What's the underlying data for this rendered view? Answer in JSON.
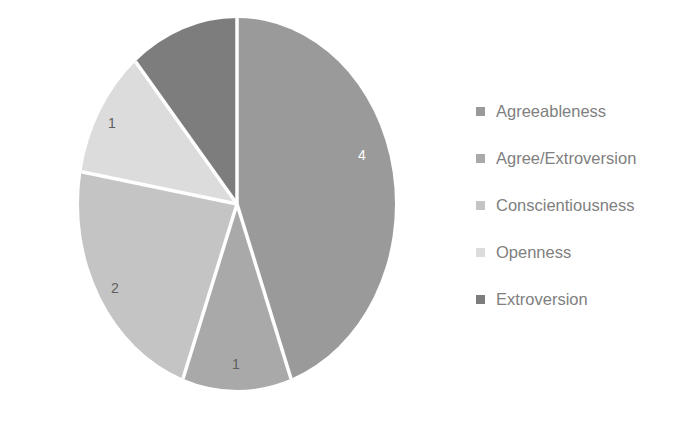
{
  "chart_data": {
    "type": "pie",
    "title": "",
    "subtitle": "",
    "xlabel": "",
    "ylabel": "",
    "total": 9,
    "grid": false,
    "legend_position": "right",
    "start_angle_deg": 0,
    "direction": "clockwise",
    "categories": [
      "Agreeableness",
      "Agree/Extroversion",
      "Conscientiousness",
      "Openness",
      "Extroversion"
    ],
    "values": [
      4,
      1,
      2,
      1,
      1
    ],
    "data_labels": [
      "4",
      "1",
      "2",
      "1",
      ""
    ],
    "colors": [
      "#9a9a9a",
      "#a9a9a9",
      "#c4c4c4",
      "#dcdcdc",
      "#7d7d7d"
    ],
    "slices": [
      {
        "name": "Agreeableness",
        "value": 4,
        "label": "4",
        "color": "#9a9a9a",
        "start_deg": 0,
        "end_deg": 160,
        "label_x": 362,
        "label_y": 155,
        "label_contrast": "on-dark"
      },
      {
        "name": "Agree/Extroversion",
        "value": 1,
        "label": "1",
        "color": "#a9a9a9",
        "start_deg": 160,
        "end_deg": 200,
        "label_x": 236,
        "label_y": 364,
        "label_contrast": "on-light"
      },
      {
        "name": "Conscientiousness",
        "value": 2,
        "label": "2",
        "color": "#c4c4c4",
        "start_deg": 200,
        "end_deg": 280,
        "label_x": 115,
        "label_y": 288,
        "label_contrast": "on-light"
      },
      {
        "name": "Openness",
        "value": 1,
        "label": "1",
        "color": "#dcdcdc",
        "start_deg": 280,
        "end_deg": 320,
        "label_x": 112,
        "label_y": 123,
        "label_contrast": "on-light"
      },
      {
        "name": "Extroversion",
        "value": 1,
        "label": "",
        "color": "#7d7d7d",
        "start_deg": 320,
        "end_deg": 360,
        "label_x": 190,
        "label_y": 72,
        "label_contrast": "on-dark"
      }
    ],
    "geometry": {
      "center_x": 237,
      "center_y": 204,
      "radius_x": 158,
      "radius_y": 186,
      "separator_color": "#ffffff",
      "separator_width": 3.5
    },
    "background_color": "#ffffff"
  },
  "legend": {
    "items": [
      {
        "label": "Agreeableness",
        "color": "#9a9a9a"
      },
      {
        "label": "Agree/Extroversion",
        "color": "#a9a9a9"
      },
      {
        "label": "Conscientiousness",
        "color": "#c4c4c4"
      },
      {
        "label": "Openness",
        "color": "#dcdcdc"
      },
      {
        "label": "Extroversion",
        "color": "#7d7d7d"
      }
    ]
  }
}
